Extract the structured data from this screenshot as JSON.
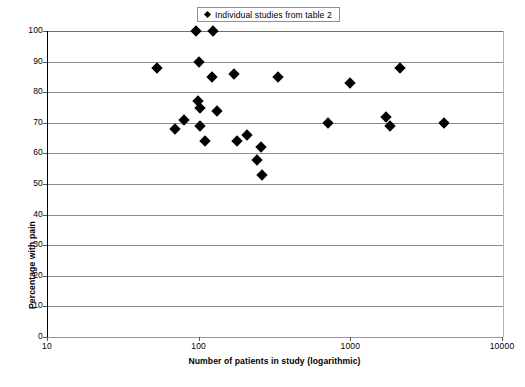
{
  "chart_data": {
    "type": "scatter",
    "title": "",
    "xlabel": "Number of patients in study (logarithmic)",
    "ylabel": "Percentage with pain",
    "xscale": "log",
    "xlim": [
      10,
      10000
    ],
    "ylim": [
      0,
      100
    ],
    "grid": true,
    "legend_position": "top-center",
    "series": [
      {
        "name": "Individual studies from table 2",
        "marker": "diamond",
        "color": "#000000",
        "points": [
          {
            "x": 52,
            "y": 88
          },
          {
            "x": 69,
            "y": 68
          },
          {
            "x": 79,
            "y": 71
          },
          {
            "x": 95,
            "y": 100
          },
          {
            "x": 99,
            "y": 90
          },
          {
            "x": 98,
            "y": 77
          },
          {
            "x": 100,
            "y": 75
          },
          {
            "x": 101,
            "y": 69
          },
          {
            "x": 108,
            "y": 64
          },
          {
            "x": 122,
            "y": 100
          },
          {
            "x": 120,
            "y": 85
          },
          {
            "x": 130,
            "y": 74
          },
          {
            "x": 168,
            "y": 86
          },
          {
            "x": 175,
            "y": 64
          },
          {
            "x": 205,
            "y": 66
          },
          {
            "x": 240,
            "y": 58
          },
          {
            "x": 255,
            "y": 62
          },
          {
            "x": 258,
            "y": 53
          },
          {
            "x": 330,
            "y": 85
          },
          {
            "x": 700,
            "y": 70
          },
          {
            "x": 980,
            "y": 83
          },
          {
            "x": 1700,
            "y": 72
          },
          {
            "x": 1800,
            "y": 69
          },
          {
            "x": 2100,
            "y": 88
          },
          {
            "x": 4100,
            "y": 70
          }
        ]
      }
    ],
    "y_ticks": [
      0,
      10,
      20,
      30,
      40,
      50,
      60,
      70,
      80,
      90,
      100
    ],
    "x_ticks": [
      10,
      100,
      1000,
      10000
    ]
  },
  "legend": {
    "label": "Individual studies from table 2",
    "marker_name": "diamond-marker"
  },
  "axes": {
    "y_title": "Percentage with pain",
    "x_title": "Number of patients in study (logarithmic)",
    "y_tick_labels": [
      "100",
      "90",
      "80",
      "70",
      "60",
      "50",
      "40",
      "30",
      "20",
      "10",
      "0"
    ],
    "x_tick_labels": [
      "10",
      "100",
      "1000",
      "10000"
    ]
  },
  "colors": {
    "marker": "#000000",
    "gridline": "#8c8c8c",
    "axis": "#000000",
    "background": "#ffffff"
  }
}
